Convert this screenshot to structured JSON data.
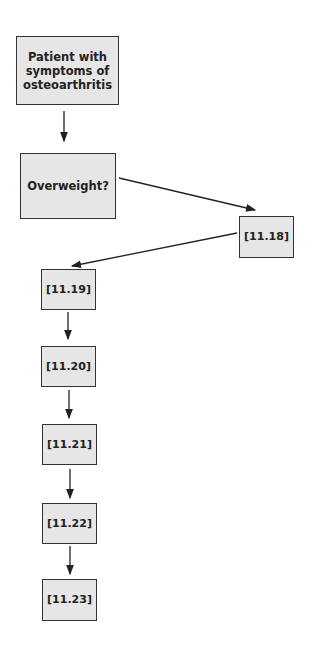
{
  "nodes": [
    {
      "id": "start",
      "label": "Patient with symptoms of osteoarthritis"
    },
    {
      "id": "q1",
      "label": "Overweight?"
    },
    {
      "id": "n1118",
      "label": "[11.18]"
    },
    {
      "id": "n1119",
      "label": "[11.19]"
    },
    {
      "id": "n1120",
      "label": "[11.20]"
    },
    {
      "id": "n1121",
      "label": "[11.21]"
    },
    {
      "id": "n1122",
      "label": "[11.22]"
    },
    {
      "id": "n1123",
      "label": "[11.23]"
    }
  ],
  "edges": [
    {
      "from": "start",
      "to": "q1"
    },
    {
      "from": "q1",
      "to": "n1118"
    },
    {
      "from": "n1118",
      "to": "n1119"
    },
    {
      "from": "n1119",
      "to": "n1120"
    },
    {
      "from": "n1120",
      "to": "n1121"
    },
    {
      "from": "n1121",
      "to": "n1122"
    },
    {
      "from": "n1122",
      "to": "n1123"
    }
  ],
  "colors": {
    "box_fill": "#e6e6e6",
    "border": "#333333",
    "arrow": "#222222"
  }
}
